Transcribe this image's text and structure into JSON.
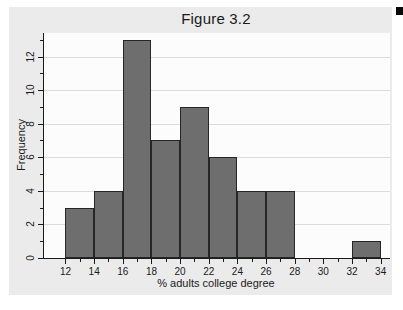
{
  "chart_data": {
    "type": "bar",
    "subtype": "histogram",
    "title": "Figure 3.2",
    "xlabel": "% adults college degree",
    "ylabel": "Frequency",
    "bins": [
      {
        "start": 12,
        "end": 14,
        "frequency": 3
      },
      {
        "start": 14,
        "end": 16,
        "frequency": 4
      },
      {
        "start": 16,
        "end": 18,
        "frequency": 13
      },
      {
        "start": 18,
        "end": 20,
        "frequency": 7
      },
      {
        "start": 20,
        "end": 22,
        "frequency": 9
      },
      {
        "start": 22,
        "end": 24,
        "frequency": 6
      },
      {
        "start": 24,
        "end": 26,
        "frequency": 4
      },
      {
        "start": 26,
        "end": 28,
        "frequency": 4
      },
      {
        "start": 32,
        "end": 34,
        "frequency": 1
      }
    ],
    "x_major_ticks": [
      12,
      14,
      16,
      18,
      20,
      22,
      24,
      26,
      28,
      30,
      32,
      34
    ],
    "x_minor_ticks": [
      13,
      15,
      17,
      19,
      21,
      23,
      25,
      27,
      29,
      31,
      33
    ],
    "y_major_ticks": [
      0,
      2,
      4,
      6,
      8,
      10,
      12
    ],
    "y_minor_ticks": [
      1,
      3,
      5,
      7,
      9,
      11,
      13
    ],
    "xlim": [
      10.5,
      34.65
    ],
    "ylim": [
      0,
      13.4
    ],
    "grid": "horizontal-major",
    "legend": "none",
    "colors": {
      "bar_fill": "#6e6e6e",
      "bar_border": "#262626",
      "grid_line": "#dcdcdc",
      "axis_line": "#1a1a1a",
      "text": "#1a1a1a",
      "figure_background": "#ebebeb",
      "plot_background": "#fcfcfc",
      "page_background": "#ffffff"
    }
  }
}
